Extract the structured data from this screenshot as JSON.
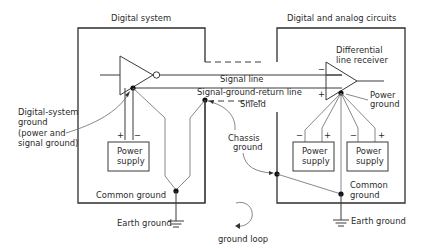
{
  "diagram": {
    "title_left": "Digital system",
    "title_right": "Digital and analog circuits",
    "labels": {
      "signal_line": "Signal line",
      "signal_ground_return": "Signal-ground-return line",
      "shield": "Shield",
      "diff_receiver_1": "Differential",
      "diff_receiver_2": "line receiver",
      "power_ground_1": "Power",
      "power_ground_2": "ground",
      "digital_ground_1": "Digital-system",
      "digital_ground_2": "ground",
      "digital_ground_3": "(power and",
      "digital_ground_4": "signal ground)",
      "chassis_ground_1": "Chassis",
      "chassis_ground_2": "ground",
      "common_ground_left": "Common ground",
      "common_ground_right_1": "Common",
      "common_ground_right_2": "ground",
      "earth_ground_left": "Earth ground",
      "earth_ground_right": "Earth ground",
      "ground_loop": "ground loop",
      "power_supply_1": "Power",
      "power_supply_2": "supply",
      "plus": "+",
      "minus": "−"
    },
    "power_supplies": [
      {
        "side": "left",
        "line1": "Power",
        "line2": "supply"
      },
      {
        "side": "right-1",
        "line1": "Power",
        "line2": "supply"
      },
      {
        "side": "right-2",
        "line1": "Power",
        "line2": "supply"
      }
    ]
  }
}
